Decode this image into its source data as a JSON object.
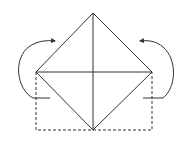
{
  "diagram": {
    "type": "origami-fold-instruction",
    "colors": {
      "background": "#ffffff",
      "line": "#333333"
    },
    "shapes": {
      "diamond": {
        "top": [
          93,
          13
        ],
        "right": [
          152,
          72
        ],
        "bottom": [
          93,
          130
        ],
        "left": [
          36,
          72
        ]
      },
      "creases": [
        {
          "from": [
            93,
            13
          ],
          "to": [
            93,
            130
          ],
          "orientation": "vertical"
        },
        {
          "from": [
            36,
            72
          ],
          "to": [
            152,
            72
          ],
          "orientation": "horizontal"
        }
      ],
      "dashed_rectangle": {
        "x1": 36,
        "y1": 72,
        "x2": 152,
        "y2": 130
      },
      "arrows": [
        {
          "side": "left",
          "direction": "fold-up-and-over-to-right"
        },
        {
          "side": "right",
          "direction": "fold-up-and-over-to-left"
        }
      ]
    }
  }
}
